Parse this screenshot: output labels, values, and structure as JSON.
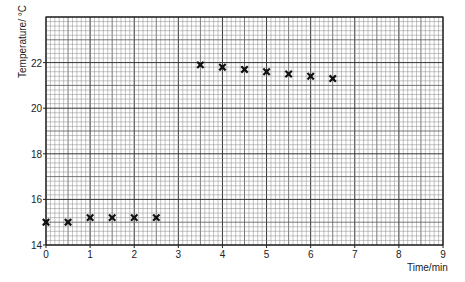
{
  "chart_data": {
    "type": "scatter",
    "title": "",
    "xlabel": "Time/min",
    "ylabel": "Temperature/ °C",
    "xlim": [
      0,
      9
    ],
    "ylim": [
      14,
      24
    ],
    "x_ticks": [
      0,
      1,
      2,
      3,
      4,
      5,
      6,
      7,
      8,
      9
    ],
    "y_ticks": [
      14,
      16,
      18,
      20,
      22
    ],
    "grid": true,
    "marker": "x",
    "series": [
      {
        "name": "Temperature",
        "x": [
          0,
          0.5,
          1,
          1.5,
          2,
          2.5,
          3.5,
          4,
          4.5,
          5,
          5.5,
          6,
          6.5
        ],
        "y": [
          15.0,
          15.0,
          15.2,
          15.2,
          15.2,
          15.2,
          21.9,
          21.8,
          21.7,
          21.6,
          21.5,
          21.4,
          21.3
        ]
      }
    ]
  }
}
